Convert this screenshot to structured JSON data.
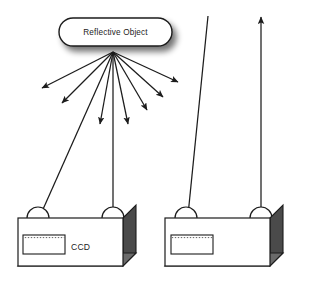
{
  "diagram": {
    "background_color": "#ffffff",
    "line_color": "#1c1c1c",
    "shadow_color": "#8a8a8a",
    "box_face_color": "#ffffff",
    "box_side_color": "#4a4a4a",
    "box_bevel_color": "#9a9a9a",
    "width": 313,
    "height": 297
  },
  "reflective_object": {
    "label": "Reflective Object",
    "shape": "rounded-rectangle",
    "x": 59,
    "y": 18,
    "width": 113,
    "height": 28,
    "radius": 14
  },
  "scatter_rays": {
    "origin_x": 113,
    "origin_y": 52,
    "count": 8,
    "description": "fan of scattered reflection rays with arrowheads",
    "rays": [
      {
        "name": "ray-far-left",
        "end_x": 42,
        "end_y": 88,
        "arrowhead": true
      },
      {
        "name": "ray-left",
        "end_x": 62,
        "end_y": 103,
        "arrowhead": true
      },
      {
        "name": "ray-left-down",
        "end_x": 100,
        "end_y": 124,
        "arrowhead": true
      },
      {
        "name": "ray-right-down",
        "end_x": 128,
        "end_y": 124,
        "arrowhead": true
      },
      {
        "name": "ray-right",
        "end_x": 147,
        "end_y": 110,
        "arrowhead": true
      },
      {
        "name": "ray-right-outer",
        "end_x": 163,
        "end_y": 97,
        "arrowhead": true
      },
      {
        "name": "ray-far-right",
        "end_x": 178,
        "end_y": 82,
        "arrowhead": true
      }
    ]
  },
  "detected_rays": [
    {
      "name": "ray-to-left-ccd",
      "start_x": 113,
      "start_y": 52,
      "end_x": 28,
      "end_y": 243,
      "arrowhead": true,
      "description": "scattered ray captured by left unit CCD"
    },
    {
      "name": "ray-to-left-lens",
      "start_x": 113,
      "start_y": 52,
      "end_x": 113,
      "end_y": 212,
      "arrowhead": false,
      "description": "vertical ray entering left unit lens"
    },
    {
      "name": "ray-to-right-ccd",
      "start_x": 208,
      "start_y": 16,
      "end_x": 185,
      "end_y": 245,
      "arrowhead": true,
      "description": "incoming ray captured by right unit CCD"
    },
    {
      "name": "ray-emitted-right",
      "start_x": 261,
      "start_y": 212,
      "end_x": 261,
      "end_y": 16,
      "arrowhead": true,
      "description": "ray emitted upward from right unit lens"
    }
  ],
  "sensor_units": [
    {
      "name": "left-sensor-unit",
      "x": 18,
      "y": 218,
      "width": 105,
      "height": 48,
      "depth": 13,
      "ccd": {
        "label": "CCD",
        "show_label": true,
        "x": 23,
        "y": 235,
        "width": 42,
        "height": 19,
        "fill_pattern": "dotted-line"
      },
      "lenses": [
        {
          "name": "lens-left",
          "cx": 38,
          "cy": 218,
          "r": 11
        },
        {
          "name": "lens-right",
          "cx": 113,
          "cy": 218,
          "r": 11
        }
      ]
    },
    {
      "name": "right-sensor-unit",
      "x": 165,
      "y": 218,
      "width": 105,
      "height": 48,
      "depth": 13,
      "ccd": {
        "label": "",
        "show_label": false,
        "x": 171,
        "y": 235,
        "width": 42,
        "height": 19,
        "fill_pattern": "dotted-line"
      },
      "lenses": [
        {
          "name": "lens-left",
          "cx": 186,
          "cy": 218,
          "r": 11
        },
        {
          "name": "lens-right",
          "cx": 261,
          "cy": 218,
          "r": 11
        }
      ]
    }
  ]
}
